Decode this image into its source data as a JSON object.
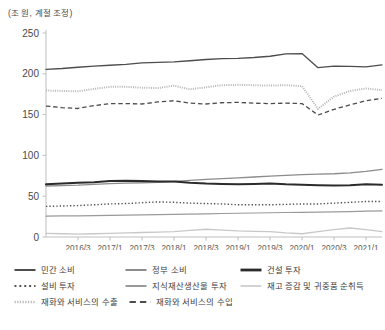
{
  "chart_data": {
    "type": "line",
    "title": "(조 원, 계절 조정)",
    "unit_note": "(조 원, 계절 조정)",
    "xlabel": "",
    "ylabel": "",
    "ylim": [
      0,
      250
    ],
    "yticks": [
      0,
      50,
      100,
      150,
      200,
      250
    ],
    "grid": false,
    "legend_position": "bottom",
    "x": [
      "2016/1",
      "2016/2",
      "2016/3",
      "2016/4",
      "2017/1",
      "2017/2",
      "2017/3",
      "2017/4",
      "2018/1",
      "2018/2",
      "2018/3",
      "2018/4",
      "2019/1",
      "2019/2",
      "2019/3",
      "2019/4",
      "2020/1",
      "2020/2",
      "2020/3",
      "2020/4",
      "2021/1",
      "2021/2"
    ],
    "xtick_labels": [
      "2016/3",
      "2017/1",
      "2017/3",
      "2018/1",
      "2018/3",
      "2019/1",
      "2019/3",
      "2020/1",
      "2020/3",
      "2021/1"
    ],
    "xtick_index": [
      2,
      4,
      6,
      8,
      10,
      12,
      14,
      16,
      18,
      20
    ],
    "series": [
      {
        "name": "민간 소비",
        "color": "#4d4d4d",
        "style": "solid",
        "width": 1.3,
        "values": [
          205.5,
          206.5,
          208.0,
          209.5,
          210.5,
          211.5,
          213.5,
          214.0,
          214.5,
          216.0,
          217.5,
          218.5,
          219.0,
          220.0,
          221.5,
          224.5,
          224.8,
          207.5,
          209.5,
          209.0,
          208.5,
          211.0
        ]
      },
      {
        "name": "정부 소비",
        "color": "#8c8c8c",
        "style": "solid",
        "width": 1.3,
        "values": [
          62.5,
          63.0,
          63.5,
          64.5,
          65.5,
          66.0,
          66.5,
          67.0,
          68.0,
          69.5,
          70.5,
          71.5,
          72.5,
          73.5,
          74.5,
          75.5,
          76.5,
          77.0,
          77.5,
          78.5,
          80.5,
          83.0
        ]
      },
      {
        "name": "건설 투자",
        "color": "#2b2b2b",
        "style": "solid",
        "width": 2.0,
        "values": [
          64.5,
          65.5,
          66.5,
          67.0,
          68.5,
          69.0,
          68.5,
          68.0,
          68.0,
          66.5,
          65.5,
          65.0,
          64.5,
          65.0,
          65.5,
          64.5,
          64.0,
          63.5,
          63.0,
          63.5,
          64.5,
          64.0
        ]
      },
      {
        "name": "설비 투자",
        "color": "#4d4d4d",
        "style": "dotted",
        "width": 1.4,
        "values": [
          37.5,
          38.0,
          38.5,
          39.5,
          40.5,
          41.0,
          42.0,
          43.0,
          42.5,
          41.5,
          41.0,
          40.5,
          39.5,
          39.5,
          39.5,
          40.0,
          40.5,
          40.5,
          41.5,
          42.5,
          43.5,
          43.5
        ]
      },
      {
        "name": "지식재산생산물 투자",
        "color": "#9a9a9a",
        "style": "solid",
        "width": 1.2,
        "values": [
          25.5,
          25.8,
          26.0,
          26.3,
          26.6,
          26.9,
          27.2,
          27.5,
          27.8,
          28.1,
          28.4,
          28.8,
          29.1,
          29.4,
          29.7,
          30.0,
          30.3,
          30.6,
          30.9,
          31.2,
          31.6,
          32.0
        ]
      },
      {
        "name": "재고 증감 및 귀중품 순취득",
        "color": "#c8c8c8",
        "style": "solid",
        "width": 1.3,
        "values": [
          4.5,
          4.0,
          3.5,
          4.0,
          4.5,
          5.0,
          5.5,
          6.0,
          6.5,
          8.0,
          9.5,
          8.5,
          7.5,
          7.0,
          6.5,
          5.0,
          4.0,
          6.5,
          9.0,
          11.0,
          9.0,
          6.5
        ]
      },
      {
        "name": "재화와 서비스의 수출",
        "color": "#b5b5b5",
        "style": "fine-dotted",
        "width": 2.0,
        "values": [
          179.5,
          179.0,
          178.5,
          181.5,
          184.0,
          184.0,
          183.0,
          182.5,
          185.5,
          181.0,
          183.5,
          186.0,
          186.5,
          186.0,
          185.5,
          186.0,
          185.0,
          157.0,
          172.0,
          179.0,
          182.0,
          180.0
        ]
      },
      {
        "name": "재화와 서비스의 수입",
        "color": "#4d4d4d",
        "style": "dashed",
        "width": 1.3,
        "values": [
          160.5,
          158.5,
          157.5,
          161.0,
          163.5,
          163.5,
          163.0,
          165.5,
          167.0,
          164.0,
          163.0,
          164.5,
          165.0,
          164.0,
          163.5,
          164.0,
          163.5,
          149.5,
          156.5,
          162.0,
          167.0,
          170.0
        ]
      }
    ]
  },
  "axis": {
    "y_labels": [
      "250",
      "200",
      "150",
      "100",
      "50",
      "0"
    ],
    "x_labels": [
      "2016/3",
      "2017/1",
      "2017/3",
      "2018/1",
      "2018/3",
      "2019/1",
      "2019/3",
      "2020/1",
      "2020/3",
      "2021/1"
    ]
  },
  "legend": {
    "rows": [
      [
        {
          "label": "민간 소비",
          "style": "solid",
          "color": "#4d4d4d",
          "width": 2.0
        },
        {
          "label": "정부 소비",
          "style": "solid",
          "color": "#8c8c8c",
          "width": 2.0
        },
        {
          "label": "건설 투자",
          "style": "solid",
          "color": "#2b2b2b",
          "width": 2.8
        }
      ],
      [
        {
          "label": "설비 투자",
          "style": "dotted",
          "color": "#4d4d4d",
          "width": 2.0
        },
        {
          "label": "지식재산생산물 투자",
          "style": "solid",
          "color": "#9a9a9a",
          "width": 2.0
        },
        {
          "label": "재고 증감 및 귀중품 순취득",
          "style": "solid",
          "color": "#c8c8c8",
          "width": 1.6
        }
      ],
      [
        {
          "label": "재화와 서비스의 수출",
          "style": "fine-dotted",
          "color": "#b5b5b5",
          "width": 2.4
        },
        {
          "label": "재화와 서비스의 수입",
          "style": "dashed",
          "color": "#4d4d4d",
          "width": 2.0
        }
      ]
    ]
  }
}
